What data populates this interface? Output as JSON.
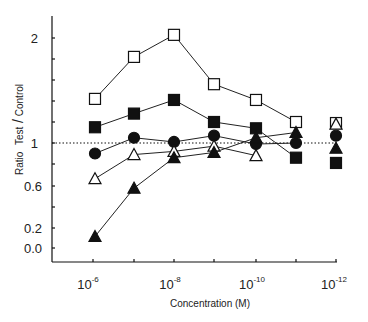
{
  "chart_data": {
    "type": "line",
    "title": "",
    "xlabel": "Concentration (M)",
    "ylabel": "Ratio Test/Control",
    "x_scale": "log (decreasing concentration)",
    "x": [
      "10^-6",
      "10^-7",
      "10^-8",
      "10^-9",
      "10^-10",
      "10^-11",
      "10^-12"
    ],
    "x_tick_labels": [
      {
        "base": "10",
        "exp": "-6",
        "at": "10^-6"
      },
      {
        "base": "10",
        "exp": "-8",
        "at": "10^-8"
      },
      {
        "base": "10",
        "exp": "-10",
        "at": "10^-10"
      },
      {
        "base": "10",
        "exp": "-12",
        "at": "10^-12"
      }
    ],
    "y_tick_labels": [
      "2",
      "1",
      "0.6",
      "0.2",
      "0.0"
    ],
    "reference_line": {
      "y": 1.0,
      "style": "dotted"
    },
    "grid": false,
    "legend": "none",
    "series": [
      {
        "name": "open-square",
        "marker": "square",
        "fill": "open",
        "values": [
          1.42,
          1.82,
          2.03,
          1.56,
          1.41,
          1.2,
          1.19
        ],
        "connected_points": 6
      },
      {
        "name": "filled-square",
        "marker": "square",
        "fill": "filled",
        "values": [
          1.15,
          1.28,
          1.41,
          1.2,
          1.14,
          0.86,
          0.81
        ],
        "connected_points": 6
      },
      {
        "name": "filled-circle",
        "marker": "circle",
        "fill": "filled",
        "values": [
          0.9,
          1.05,
          1.01,
          1.07,
          0.99,
          1.0,
          1.07
        ],
        "connected_points": 6
      },
      {
        "name": "open-triangle",
        "marker": "triangle",
        "fill": "open",
        "values": [
          0.66,
          0.89,
          0.92,
          0.97,
          0.88,
          null,
          1.18
        ],
        "connected_points": 5
      },
      {
        "name": "filled-triangle",
        "marker": "triangle",
        "fill": "filled",
        "values": [
          0.11,
          0.57,
          0.86,
          0.91,
          1.05,
          1.1,
          0.95
        ],
        "connected_points": 6
      }
    ]
  },
  "labels": {
    "y2": "2",
    "y1": "1",
    "y06": "0.6",
    "y02": "0.2",
    "y00": "0.0",
    "ylabel_ratio": "Ratio",
    "ylabel_test": "Test",
    "ylabel_slash": "/",
    "ylabel_control": "Control",
    "xlabel": "Concentration (M)",
    "x6_base": "10",
    "x6_exp": "-6",
    "x8_base": "10",
    "x8_exp": "-8",
    "x10_base": "10",
    "x10_exp": "-10",
    "x12_base": "10",
    "x12_exp": "-12"
  }
}
